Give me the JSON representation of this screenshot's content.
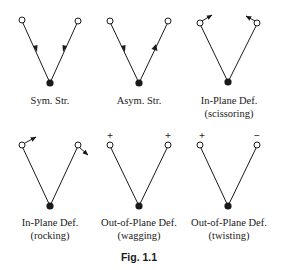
{
  "figure": {
    "caption": "Fig. 1.1",
    "modes": [
      {
        "name": "Sym. Str.",
        "subname": ""
      },
      {
        "name": "Asym. Str.",
        "subname": ""
      },
      {
        "name": "In-Plane Def.",
        "subname": "(scissoring)"
      },
      {
        "name": "In-Plane Def.",
        "subname": "(rocking)"
      },
      {
        "name": "Out-of-Plane Def.",
        "subname": "(wagging)"
      },
      {
        "name": "Out-of-Plane Def.",
        "subname": "(twisting)"
      }
    ],
    "signs": {
      "wagging_left": "+",
      "wagging_right": "+",
      "twisting_left": "+",
      "twisting_right": "−"
    }
  }
}
